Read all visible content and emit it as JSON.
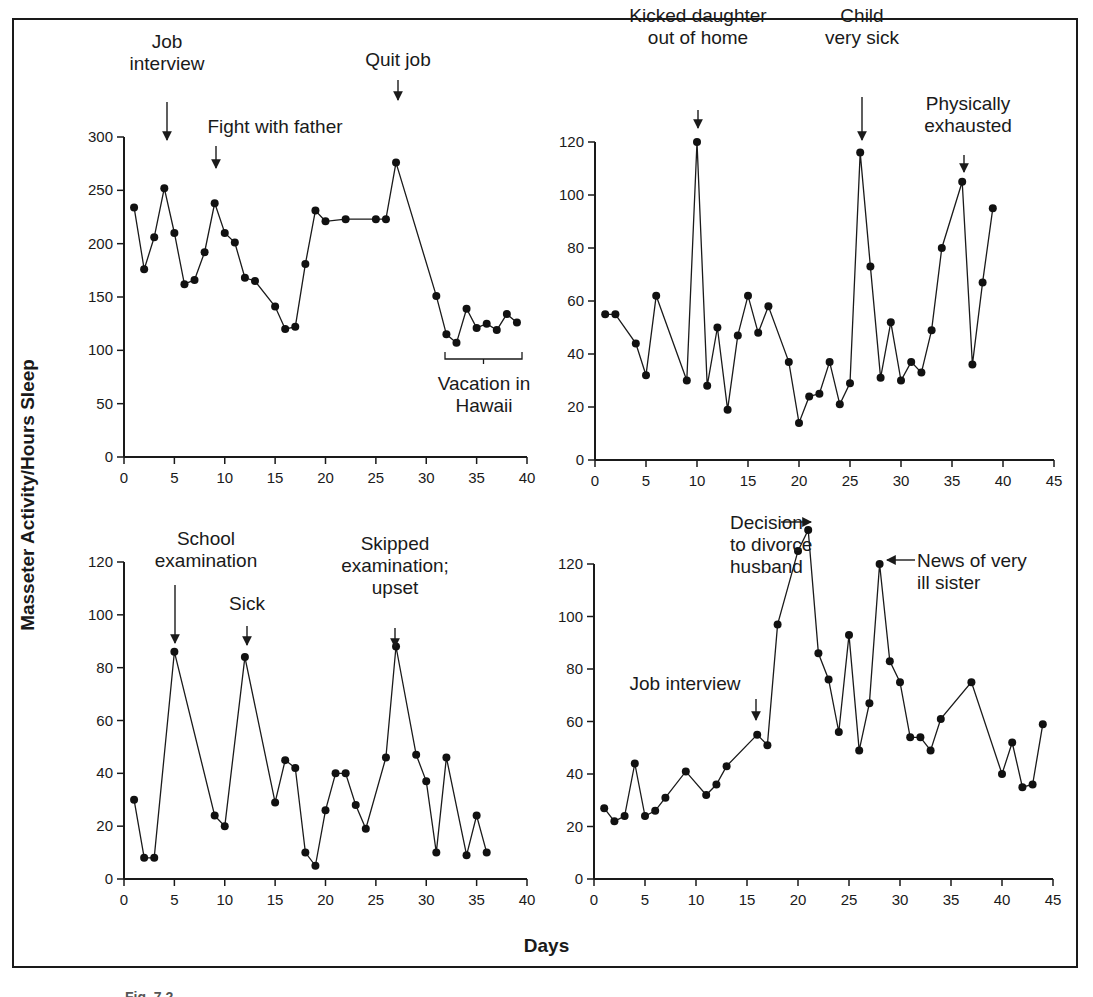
{
  "figure": {
    "y_axis_label": "Masseter Activity/Hours Sleep",
    "x_axis_label": "Days",
    "caption": "Fig. 7.2"
  },
  "chart_data": [
    {
      "type": "line",
      "panel": "top-left",
      "xlabel": "Days",
      "ylabel": "Masseter Activity/Hours Sleep",
      "xlim": [
        0,
        40
      ],
      "ylim": [
        0,
        300
      ],
      "xticks": [
        0,
        5,
        10,
        15,
        20,
        25,
        30,
        35,
        40
      ],
      "yticks": [
        0,
        50,
        100,
        150,
        200,
        250,
        300
      ],
      "grid": false,
      "x": [
        1,
        2,
        3,
        4,
        5,
        6,
        7,
        8,
        9,
        10,
        11,
        12,
        13,
        15,
        16,
        17,
        18,
        19,
        20,
        22,
        25,
        26,
        27,
        31,
        32,
        33,
        34,
        35,
        36,
        37,
        38,
        39
      ],
      "values": [
        234,
        176,
        206,
        252,
        210,
        162,
        166,
        192,
        238,
        210,
        201,
        168,
        165,
        141,
        120,
        122,
        181,
        231,
        221,
        223,
        223,
        223,
        276,
        151,
        115,
        107,
        139,
        121,
        125,
        119,
        134,
        126
      ],
      "annotations": [
        {
          "text": "Job interview",
          "x": 4,
          "y": 252
        },
        {
          "text": "Fight with father",
          "x": 9,
          "y": 238
        },
        {
          "text": "Quit job",
          "x": 27,
          "y": 276
        },
        {
          "text": "Vacation in Hawaii",
          "x_range": [
            32,
            39
          ],
          "bracket": true
        }
      ]
    },
    {
      "type": "line",
      "panel": "top-right",
      "xlim": [
        0,
        45
      ],
      "ylim": [
        0,
        120
      ],
      "xticks": [
        0,
        5,
        10,
        15,
        20,
        25,
        30,
        35,
        40,
        45
      ],
      "yticks": [
        0,
        20,
        40,
        60,
        80,
        100,
        120
      ],
      "grid": false,
      "x": [
        1,
        2,
        4,
        5,
        6,
        9,
        10,
        11,
        12,
        13,
        14,
        15,
        16,
        17,
        19,
        20,
        21,
        22,
        23,
        24,
        25,
        26,
        27,
        28,
        29,
        30,
        31,
        32,
        33,
        34,
        36,
        37,
        38,
        39
      ],
      "values": [
        55,
        55,
        44,
        32,
        62,
        30,
        120,
        28,
        50,
        19,
        47,
        62,
        48,
        58,
        37,
        14,
        24,
        25,
        37,
        21,
        29,
        116,
        73,
        31,
        52,
        30,
        37,
        33,
        49,
        80,
        105,
        36,
        67,
        95
      ],
      "annotations": [
        {
          "text": "Kicked daughter out of home",
          "x": 10,
          "y": 120
        },
        {
          "text": "Child very sick",
          "x": 26,
          "y": 116
        },
        {
          "text": "Physically exhausted",
          "x": 36,
          "y": 105
        }
      ]
    },
    {
      "type": "line",
      "panel": "bottom-left",
      "xlim": [
        0,
        40
      ],
      "ylim": [
        0,
        120
      ],
      "xticks": [
        0,
        5,
        10,
        15,
        20,
        25,
        30,
        35,
        40
      ],
      "yticks": [
        0,
        20,
        40,
        60,
        80,
        100,
        120
      ],
      "grid": false,
      "x": [
        1,
        2,
        3,
        5,
        9,
        10,
        12,
        15,
        16,
        17,
        18,
        19,
        20,
        21,
        22,
        23,
        24,
        26,
        27,
        29,
        30,
        31,
        32,
        34,
        35,
        36
      ],
      "values": [
        30,
        8,
        8,
        86,
        24,
        20,
        84,
        29,
        45,
        42,
        10,
        5,
        26,
        40,
        40,
        28,
        19,
        46,
        88,
        47,
        37,
        10,
        46,
        9,
        24,
        10
      ],
      "annotations": [
        {
          "text": "School examination",
          "x": 5,
          "y": 86
        },
        {
          "text": "Sick",
          "x": 12,
          "y": 84
        },
        {
          "text": "Skipped examination; upset",
          "x": 27,
          "y": 88
        }
      ]
    },
    {
      "type": "line",
      "panel": "bottom-right",
      "xlim": [
        0,
        45
      ],
      "ylim": [
        0,
        120
      ],
      "xticks": [
        0,
        5,
        10,
        15,
        20,
        25,
        30,
        35,
        40,
        45
      ],
      "yticks": [
        0,
        20,
        40,
        60,
        80,
        100,
        120
      ],
      "grid": false,
      "x": [
        1,
        2,
        3,
        4,
        5,
        6,
        7,
        9,
        11,
        12,
        13,
        16,
        17,
        18,
        20,
        21,
        22,
        23,
        24,
        25,
        26,
        27,
        28,
        29,
        30,
        31,
        32,
        33,
        34,
        37,
        40,
        41,
        42,
        43,
        44
      ],
      "values": [
        27,
        22,
        24,
        44,
        24,
        26,
        31,
        41,
        32,
        36,
        43,
        55,
        51,
        97,
        125,
        133,
        86,
        76,
        56,
        93,
        49,
        67,
        120,
        83,
        75,
        54,
        54,
        49,
        61,
        75,
        40,
        52,
        35,
        36,
        59
      ],
      "annotations": [
        {
          "text": "Job interview",
          "x": 16,
          "y": 55
        },
        {
          "text": "Decision to divorce husband",
          "x": 21,
          "y": 133
        },
        {
          "text": "News of very ill sister",
          "x": 28,
          "y": 120
        }
      ]
    }
  ]
}
